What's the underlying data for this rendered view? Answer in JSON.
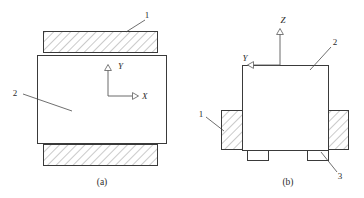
{
  "figure": {
    "background_color": "#ffffff",
    "line_color": "#3a3a3a",
    "hatch_color": "#7a7a7a",
    "text_color": "#2b2b2b",
    "panels": [
      {
        "id": "panel-a",
        "caption": "(a)",
        "view": "front view",
        "part_labels": [
          {
            "id": "a-label-1",
            "text": "1",
            "refers_to": "hatched clamp block"
          },
          {
            "id": "a-label-2",
            "text": "2",
            "refers_to": "main body"
          }
        ],
        "axes": [
          {
            "id": "a-axis-y",
            "text": "Y",
            "direction": "up"
          },
          {
            "id": "a-axis-x",
            "text": "X",
            "direction": "right"
          }
        ]
      },
      {
        "id": "panel-b",
        "caption": "(b)",
        "view": "side view",
        "part_labels": [
          {
            "id": "b-label-1",
            "text": "1",
            "refers_to": "left hatched clamp block"
          },
          {
            "id": "b-label-2",
            "text": "2",
            "refers_to": "main body"
          },
          {
            "id": "b-label-3",
            "text": "3",
            "refers_to": "support foot"
          }
        ],
        "axes": [
          {
            "id": "b-axis-z",
            "text": "Z",
            "direction": "up"
          },
          {
            "id": "b-axis-y",
            "text": "Y",
            "direction": "left"
          }
        ]
      }
    ]
  }
}
